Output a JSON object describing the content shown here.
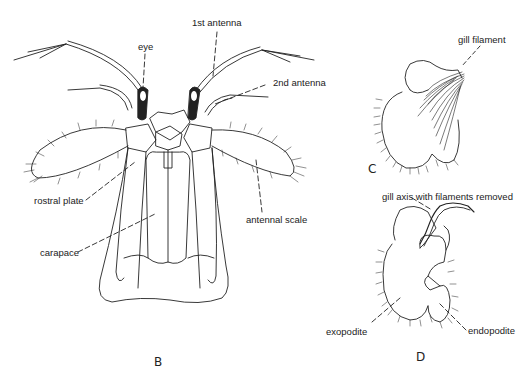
{
  "figure": {
    "panels": [
      {
        "id": "B",
        "label": "B"
      },
      {
        "id": "C",
        "label": "C"
      },
      {
        "id": "D",
        "label": "D"
      }
    ],
    "labels": {
      "eye": "eye",
      "first_antenna": "1st antenna",
      "second_antenna": "2nd antenna",
      "rostral_plate": "rostral plate",
      "antennal_scale": "antennal scale",
      "carapace": "carapace",
      "gill_filament": "gill filament",
      "gill_axis": "gill axis with filaments removed",
      "exopodite": "exopodite",
      "endopodite": "endopodite"
    },
    "colors": {
      "ink": "#222222",
      "background": "#ffffff"
    }
  }
}
